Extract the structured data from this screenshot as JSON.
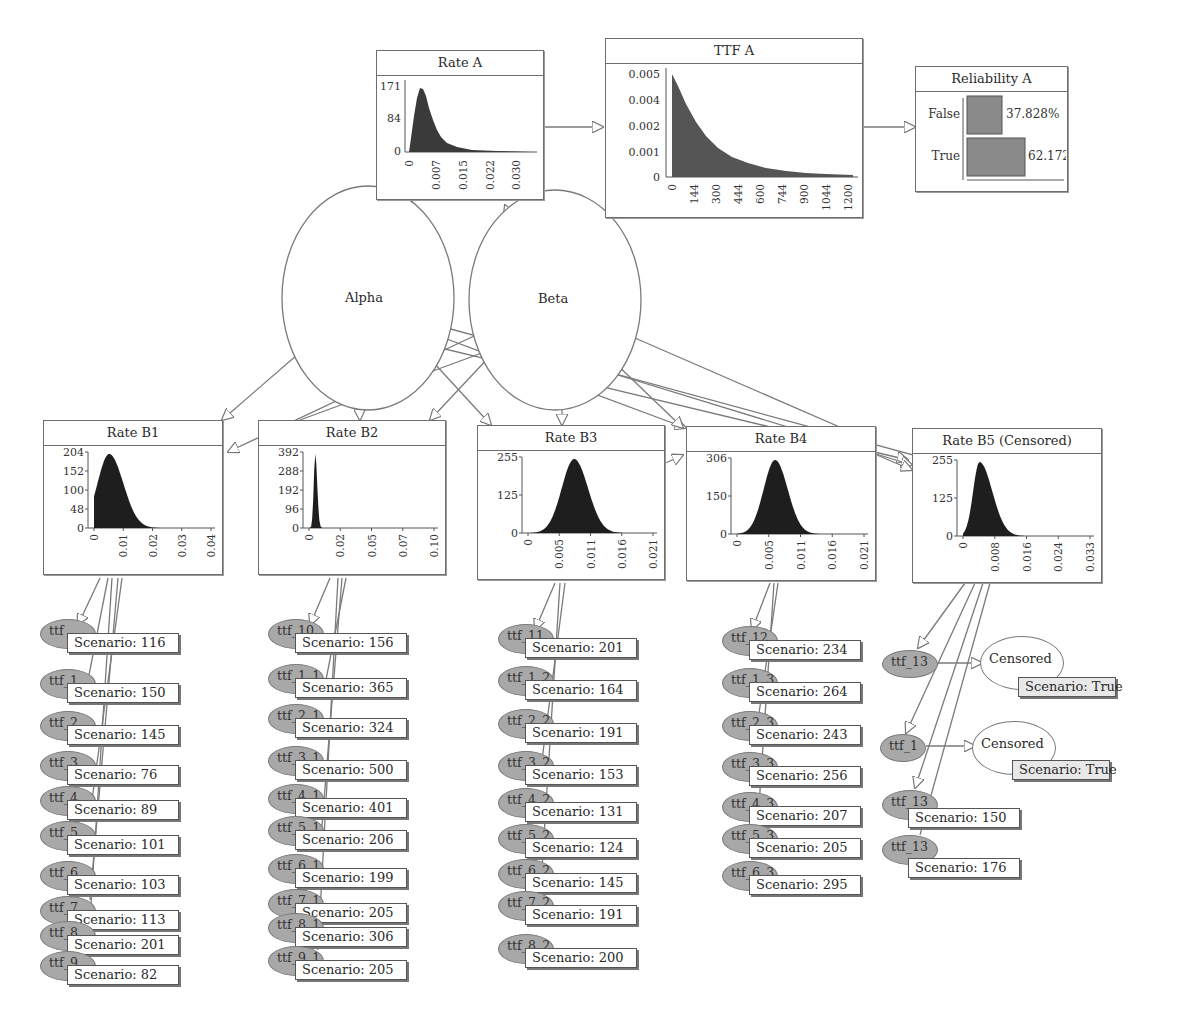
{
  "diagram": {
    "parents": [
      {
        "id": "alpha",
        "label": "Alpha"
      },
      {
        "id": "beta",
        "label": "Beta"
      }
    ],
    "rate_a": {
      "title": "Rate A",
      "y_ticks": [
        "171",
        "84",
        "0"
      ],
      "x_ticks": [
        "0",
        "0.007",
        "0.015",
        "0.022",
        "0.030"
      ]
    },
    "ttf_a": {
      "title": "TTF A",
      "y_ticks": [
        "0.005",
        "0.004",
        "0.002",
        "0.001",
        "0"
      ],
      "x_ticks": [
        "0",
        "144",
        "300",
        "444",
        "600",
        "744",
        "900",
        "1044",
        "1200"
      ]
    },
    "reliability_a": {
      "title": "Reliability A",
      "states": [
        {
          "label": "False",
          "value": "37.828%"
        },
        {
          "label": "True",
          "value": "62.172%"
        }
      ]
    },
    "rate_b": [
      {
        "title": "Rate B1",
        "y_ticks": [
          "204",
          "152",
          "100",
          "48",
          "0"
        ],
        "x_ticks": [
          "0",
          "0.01",
          "0.02",
          "0.03",
          "0.04"
        ]
      },
      {
        "title": "Rate B2",
        "y_ticks": [
          "392",
          "288",
          "192",
          "96",
          "0"
        ],
        "x_ticks": [
          "0",
          "0.02",
          "0.05",
          "0.07",
          "0.10"
        ]
      },
      {
        "title": "Rate B3",
        "y_ticks": [
          "255",
          "125",
          "0"
        ],
        "x_ticks": [
          "0",
          "0.005",
          "0.011",
          "0.016",
          "0.021"
        ]
      },
      {
        "title": "Rate B4",
        "y_ticks": [
          "306",
          "150",
          "0"
        ],
        "x_ticks": [
          "0",
          "0.005",
          "0.011",
          "0.016",
          "0.021"
        ]
      },
      {
        "title": "Rate B5 (Censored)",
        "y_ticks": [
          "255",
          "125",
          "0"
        ],
        "x_ticks": [
          "0",
          "0.008",
          "0.016",
          "0.024",
          "0.033"
        ]
      }
    ],
    "observations": {
      "b1": [
        {
          "node": "ttf",
          "scenario": "Scenario: 116"
        },
        {
          "node": "ttf_1",
          "scenario": "Scenario: 150"
        },
        {
          "node": "ttf_2",
          "scenario": "Scenario: 145"
        },
        {
          "node": "ttf_3",
          "scenario": "Scenario: 76"
        },
        {
          "node": "ttf_4",
          "scenario": "Scenario: 89"
        },
        {
          "node": "ttf_5",
          "scenario": "Scenario: 101"
        },
        {
          "node": "ttf_6",
          "scenario": "Scenario: 103"
        },
        {
          "node": "ttf_7",
          "scenario": "Scenario: 113"
        },
        {
          "node": "ttf_8",
          "scenario": "Scenario: 201"
        },
        {
          "node": "ttf_9",
          "scenario": "Scenario: 82"
        }
      ],
      "b2": [
        {
          "node": "ttf_10",
          "scenario": "Scenario: 156"
        },
        {
          "node": "ttf_1_1",
          "scenario": "Scenario: 365"
        },
        {
          "node": "ttf_2_1",
          "scenario": "Scenario: 324"
        },
        {
          "node": "ttf_3_1",
          "scenario": "Scenario: 500"
        },
        {
          "node": "ttf_4_1",
          "scenario": "Scenario: 401"
        },
        {
          "node": "ttf_5_1",
          "scenario": "Scenario: 206"
        },
        {
          "node": "ttf_6_1",
          "scenario": "Scenario: 199"
        },
        {
          "node": "ttf_7_1",
          "scenario": "Scenario: 205"
        },
        {
          "node": "ttf_8_1",
          "scenario": "Scenario: 306"
        },
        {
          "node": "ttf_9_1",
          "scenario": "Scenario: 205"
        }
      ],
      "b3": [
        {
          "node": "ttf_11",
          "scenario": "Scenario: 201"
        },
        {
          "node": "ttf_1_2",
          "scenario": "Scenario: 164"
        },
        {
          "node": "ttf_2_2",
          "scenario": "Scenario: 191"
        },
        {
          "node": "ttf_3_2",
          "scenario": "Scenario: 153"
        },
        {
          "node": "ttf_4_2",
          "scenario": "Scenario: 131"
        },
        {
          "node": "ttf_5_2",
          "scenario": "Scenario: 124"
        },
        {
          "node": "ttf_6_2",
          "scenario": "Scenario: 145"
        },
        {
          "node": "ttf_7_2",
          "scenario": "Scenario: 191"
        },
        {
          "node": "ttf_8_2",
          "scenario": "Scenario: 200"
        }
      ],
      "b4": [
        {
          "node": "ttf_12",
          "scenario": "Scenario: 234"
        },
        {
          "node": "ttf_1_3",
          "scenario": "Scenario: 264"
        },
        {
          "node": "ttf_2_3",
          "scenario": "Scenario: 243"
        },
        {
          "node": "ttf_3_3",
          "scenario": "Scenario: 256"
        },
        {
          "node": "ttf_4_3",
          "scenario": "Scenario: 207"
        },
        {
          "node": "ttf_5_3",
          "scenario": "Scenario: 205"
        },
        {
          "node": "ttf_6_3",
          "scenario": "Scenario: 295"
        }
      ],
      "b5": {
        "censored": [
          {
            "node": "ttf_13",
            "censor_label": "Censored",
            "scenario": "Scenario: True"
          },
          {
            "node": "ttf_1",
            "censor_label": "Censored",
            "scenario": "Scenario: True"
          }
        ],
        "observed": [
          {
            "node": "ttf_13",
            "scenario": "Scenario: 150"
          },
          {
            "node": "ttf_13",
            "scenario": "Scenario: 176"
          }
        ]
      }
    }
  }
}
